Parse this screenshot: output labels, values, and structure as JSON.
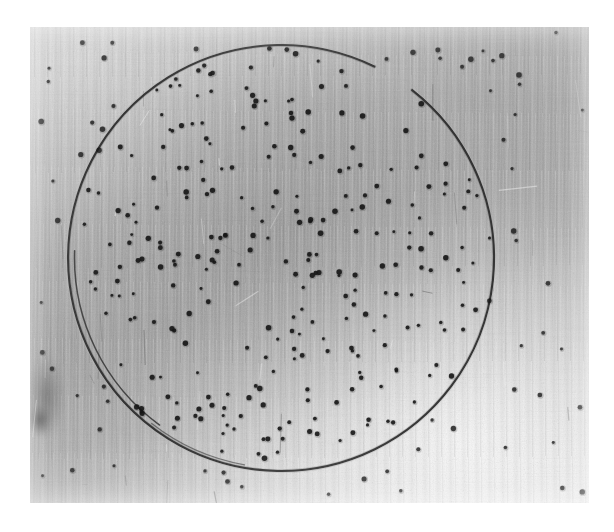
{
  "image": {
    "kind": "photograph",
    "subject": "metal plate with scribed circle and punched dots",
    "width": 614,
    "height": 532,
    "background_color": "#ffffff",
    "caption": "",
    "title": ""
  },
  "photo": {
    "left": 30,
    "top": 27,
    "width": 559,
    "height": 476,
    "border_color": "#ffffff",
    "plate_tone_center": "#9a9a9a",
    "plate_tone_highlight": "#e3e3e3",
    "plate_tone_shadow": "#8d8d8d",
    "surface_finish": "brushed-vertical-grain"
  },
  "circle": {
    "name": "scribed-circle",
    "center_x": 281,
    "center_y": 258,
    "radius": 213,
    "stroke_color": "#2b2b2b",
    "stroke_width": 2.1,
    "gap_start_deg": -64,
    "gap_end_deg": -52,
    "has_overshoot_arc_at_bottom": true,
    "overshoot_note": "double line where the scribe overran the start point at lower centre"
  },
  "dots": {
    "name": "punched-dots",
    "color": "#161616",
    "count": 342,
    "radius_min": 1.4,
    "radius_max": 2.8,
    "distribution": "random scatter, denser inside the circle"
  },
  "marks": {
    "scratch_color": "#6d6d6d",
    "highlight_color": "#f2f2f2",
    "count": 46
  },
  "annotations": {
    "top_left_tick_label": "",
    "visible_text": "none"
  }
}
